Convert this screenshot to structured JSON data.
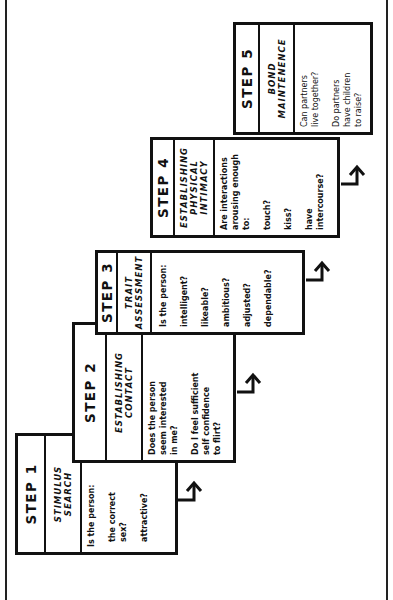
{
  "diagram": {
    "orientation": "rotated-90-ccw",
    "steps": [
      {
        "step_label": "STEP 1",
        "title": "STIMULUS\nSEARCH",
        "question": "Is the person:",
        "options": [
          "the correct\n  sex?",
          "attractive?"
        ]
      },
      {
        "step_label": "STEP 2",
        "title": "ESTABLISHING\nCONTACT",
        "question": "Does the person\n  seem interested\n  in me?",
        "options": [
          "Do I feel sufficient\n  self confidence\n  to flirt?"
        ]
      },
      {
        "step_label": "STEP 3",
        "title": "TRAIT\nASSESSMENT",
        "question": "Is the person:",
        "options": [
          "intelligent?",
          "likeable?",
          "ambitious?",
          "adjusted?",
          "dependable?"
        ]
      },
      {
        "step_label": "STEP 4",
        "title": "ESTABLISHING\nPHYSICAL\nINTIMACY",
        "question": "Are interactions\narousing enough\nto:",
        "options": [
          "touch?",
          "kiss?",
          "have\n  intercourse?"
        ]
      },
      {
        "step_label": "STEP 5",
        "title": "BOND\nMAINTENENCE",
        "question": "Can partners\n  live together?",
        "options": [
          "Do partners\n  have children\n  to raise?"
        ]
      }
    ]
  }
}
